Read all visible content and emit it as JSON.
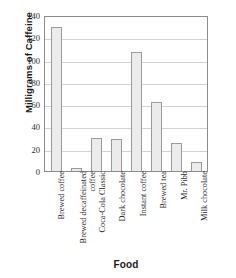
{
  "chart_data": {
    "type": "bar",
    "title": "",
    "xlabel": "Food",
    "ylabel": "Milligrams of Caffeine",
    "categories": [
      "Brewed coffee",
      "Brewed decaffeinated coffee",
      "Coca-Cola Classic",
      "Dark chocolate",
      "Instant coffee",
      "Brewed tea",
      "Mr. Pibb",
      "Milk chocolate"
    ],
    "values": [
      129,
      3,
      30,
      29,
      107,
      62,
      25,
      8
    ],
    "ylim": [
      0,
      140
    ],
    "ytick_labels": [
      "0",
      "20",
      "40",
      "60",
      "80",
      "100",
      "120",
      "140"
    ],
    "ytick_values": [
      0,
      20,
      40,
      60,
      80,
      100,
      120,
      140
    ],
    "grid": true,
    "grid_orientation": "horizontal",
    "legend": "none",
    "bar_fill_color": "#ebebeb",
    "bar_edge_color": "#9b9b9b",
    "axis_color": "#8c8c8c",
    "grid_color": "#d2d2d2"
  }
}
